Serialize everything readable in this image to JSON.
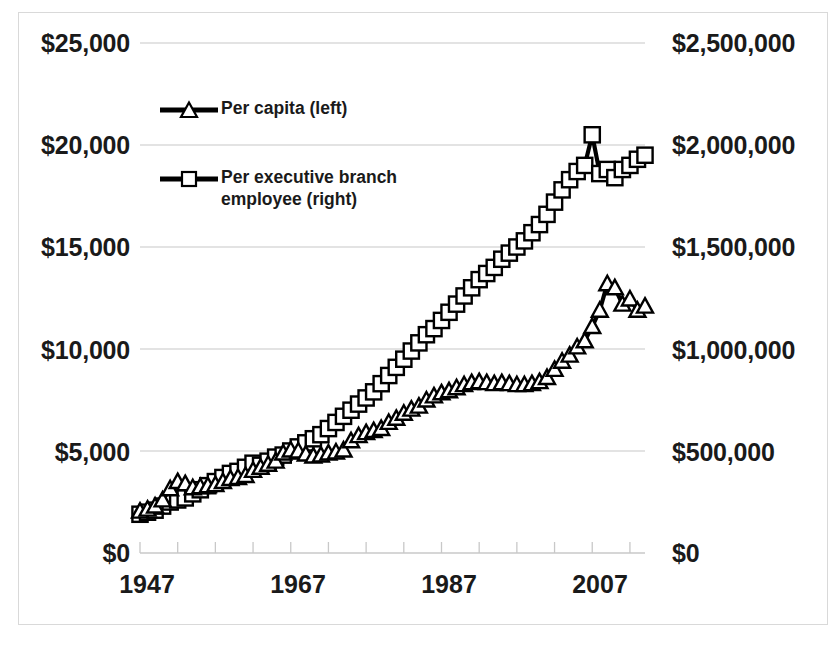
{
  "chart_data": {
    "type": "line",
    "title": "",
    "subtitle": "",
    "xlabel": "",
    "ylabel": "",
    "grid": true,
    "legend_position": "inside-top-left",
    "x": [
      1947,
      1948,
      1949,
      1950,
      1951,
      1952,
      1953,
      1954,
      1955,
      1956,
      1957,
      1958,
      1959,
      1960,
      1961,
      1962,
      1963,
      1964,
      1965,
      1966,
      1967,
      1968,
      1969,
      1970,
      1971,
      1972,
      1973,
      1974,
      1975,
      1976,
      1977,
      1978,
      1979,
      1980,
      1981,
      1982,
      1983,
      1984,
      1985,
      1986,
      1987,
      1988,
      1989,
      1990,
      1991,
      1992,
      1993,
      1994,
      1995,
      1996,
      1997,
      1998,
      1999,
      2000,
      2001,
      2002,
      2003,
      2004,
      2005,
      2006,
      2007,
      2008,
      2009,
      2010,
      2011,
      2012,
      2013,
      2014
    ],
    "x_tick_labels": [
      "1947",
      "1967",
      "1987",
      "2007"
    ],
    "x_tick_values": [
      1947,
      1967,
      1987,
      2007
    ],
    "x_minor_tick_interval": 5,
    "xlim": [
      1947,
      2014
    ],
    "axes": [
      {
        "id": "left",
        "side": "left",
        "ylim": [
          0,
          25000
        ],
        "tick_labels": [
          "$25,000",
          "$20,000",
          "$15,000",
          "$10,000",
          "$5,000",
          "$0"
        ],
        "tick_values": [
          25000,
          20000,
          15000,
          10000,
          5000,
          0
        ]
      },
      {
        "id": "right",
        "side": "right",
        "ylim": [
          0,
          2500000
        ],
        "tick_labels": [
          "$2,500,000",
          "$2,000,000",
          "$1,500,000",
          "$1,000,000",
          "$500,000",
          "$0"
        ],
        "tick_values": [
          2500000,
          2000000,
          1500000,
          1000000,
          500000,
          0
        ]
      }
    ],
    "series": [
      {
        "name": "Per capita (left)",
        "axis": "left",
        "marker": "triangle",
        "color": "#000000",
        "values": [
          2050,
          2150,
          2300,
          2600,
          3150,
          3500,
          3400,
          3200,
          3250,
          3300,
          3350,
          3500,
          3650,
          3700,
          3800,
          4050,
          4200,
          4350,
          4500,
          4900,
          5050,
          5000,
          4850,
          4750,
          4800,
          4900,
          4950,
          5050,
          5500,
          5750,
          5900,
          6000,
          6100,
          6400,
          6600,
          6850,
          7050,
          7200,
          7500,
          7700,
          7850,
          7950,
          8100,
          8250,
          8350,
          8400,
          8350,
          8300,
          8350,
          8300,
          8250,
          8250,
          8300,
          8400,
          8600,
          9000,
          9400,
          9700,
          10100,
          10400,
          11100,
          11900,
          13200,
          13000,
          12200,
          12450,
          11900,
          12100
        ]
      },
      {
        "name": "Per executive branch employee (right)",
        "axis": "right",
        "marker": "square",
        "color": "#000000",
        "values": [
          190000,
          200000,
          210000,
          230000,
          250000,
          260000,
          270000,
          290000,
          310000,
          330000,
          350000,
          370000,
          390000,
          400000,
          420000,
          440000,
          430000,
          450000,
          470000,
          480000,
          500000,
          520000,
          540000,
          560000,
          580000,
          610000,
          640000,
          670000,
          700000,
          730000,
          760000,
          790000,
          830000,
          870000,
          910000,
          950000,
          990000,
          1030000,
          1070000,
          1100000,
          1140000,
          1180000,
          1220000,
          1260000,
          1300000,
          1340000,
          1370000,
          1400000,
          1440000,
          1470000,
          1500000,
          1530000,
          1570000,
          1610000,
          1660000,
          1720000,
          1780000,
          1830000,
          1870000,
          1900000,
          2050000,
          1860000,
          1880000,
          1840000,
          1880000,
          1900000,
          1930000,
          1950000
        ]
      }
    ],
    "annotations": []
  },
  "legend": {
    "items": [
      {
        "label": "Per capita (left)",
        "marker": "triangle"
      },
      {
        "label": "Per executive branch\nemployee (right)",
        "marker": "square"
      }
    ]
  },
  "axis_left": {
    "labels": [
      "$25,000",
      "$20,000",
      "$15,000",
      "$10,000",
      "$5,000",
      "$0"
    ]
  },
  "axis_right": {
    "labels": [
      "$2,500,000",
      "$2,000,000",
      "$1,500,000",
      "$1,000,000",
      "$500,000",
      "$0"
    ]
  },
  "axis_bottom": {
    "labels": [
      "1947",
      "1967",
      "1987",
      "2007"
    ]
  },
  "colors": {
    "ink": "#000000",
    "grid": "#c8c8c8",
    "frame": "#d9d9d9",
    "background": "#ffffff"
  }
}
